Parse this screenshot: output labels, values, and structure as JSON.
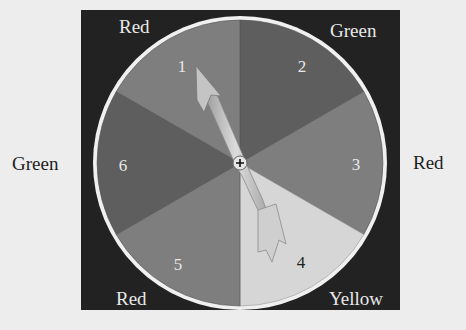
{
  "spinner": {
    "sectors": [
      {
        "number": "1",
        "color_name": "Red",
        "fill": "#7e7e7e"
      },
      {
        "number": "2",
        "color_name": "Green",
        "fill": "#5e5e5e"
      },
      {
        "number": "3",
        "color_name": "Red",
        "fill": "#7e7e7e"
      },
      {
        "number": "4",
        "color_name": "Yellow",
        "fill": "#d6d6d6"
      },
      {
        "number": "5",
        "color_name": "Red",
        "fill": "#7e7e7e"
      },
      {
        "number": "6",
        "color_name": "Green",
        "fill": "#5e5e5e"
      }
    ],
    "pointer_target": "1",
    "colors": {
      "board": "#222222",
      "rim": "#f0f0f0",
      "arrow": "#c8c8c8",
      "number_light": "#e8e8e8",
      "number_dark": "#1e1e1e"
    }
  },
  "labels": {
    "top_left": "Red",
    "top_right": "Green",
    "left": "Green",
    "right": "Red",
    "bottom_left": "Red",
    "bottom_right": "Yellow"
  }
}
